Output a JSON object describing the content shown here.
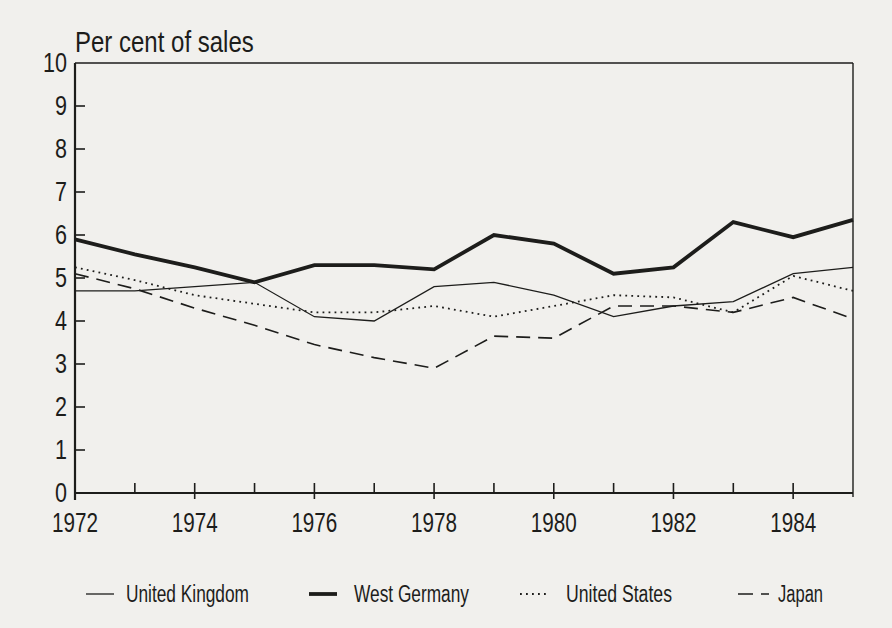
{
  "figure": {
    "background": "#f1f0ed",
    "ink": "#1d1d1b"
  },
  "chart_data": {
    "type": "line",
    "title": "Per cent of sales",
    "xlabel": "",
    "ylabel": "Per cent of sales",
    "x": [
      1972,
      1973,
      1974,
      1975,
      1976,
      1977,
      1978,
      1979,
      1980,
      1981,
      1982,
      1983,
      1984,
      1985
    ],
    "xlim": [
      1972,
      1985
    ],
    "ylim": [
      0,
      10
    ],
    "y_ticks": [
      0,
      1,
      2,
      3,
      4,
      5,
      6,
      7,
      8,
      9,
      10
    ],
    "x_labeled_ticks": [
      1972,
      1974,
      1976,
      1978,
      1980,
      1982,
      1984
    ],
    "grid": "off",
    "legend_position": "bottom",
    "series": [
      {
        "name": "United Kingdom",
        "style": "thin-solid",
        "values": [
          4.7,
          4.7,
          4.8,
          4.9,
          4.1,
          4.0,
          4.8,
          4.9,
          4.6,
          4.1,
          4.35,
          4.45,
          5.1,
          5.25
        ]
      },
      {
        "name": "West Germany",
        "style": "thick-solid",
        "values": [
          5.9,
          5.55,
          5.25,
          4.9,
          5.3,
          5.3,
          5.2,
          6.0,
          5.8,
          5.1,
          5.25,
          6.3,
          5.95,
          6.35
        ]
      },
      {
        "name": "United States",
        "style": "dotted",
        "values": [
          5.25,
          4.95,
          4.6,
          4.4,
          4.2,
          4.2,
          4.35,
          4.1,
          4.35,
          4.6,
          4.55,
          4.2,
          5.05,
          4.7
        ]
      },
      {
        "name": "Japan",
        "style": "dashed",
        "values": [
          5.1,
          4.75,
          4.3,
          3.9,
          3.45,
          3.15,
          2.9,
          3.65,
          3.6,
          4.35,
          4.35,
          4.2,
          4.55,
          4.05
        ]
      }
    ]
  }
}
